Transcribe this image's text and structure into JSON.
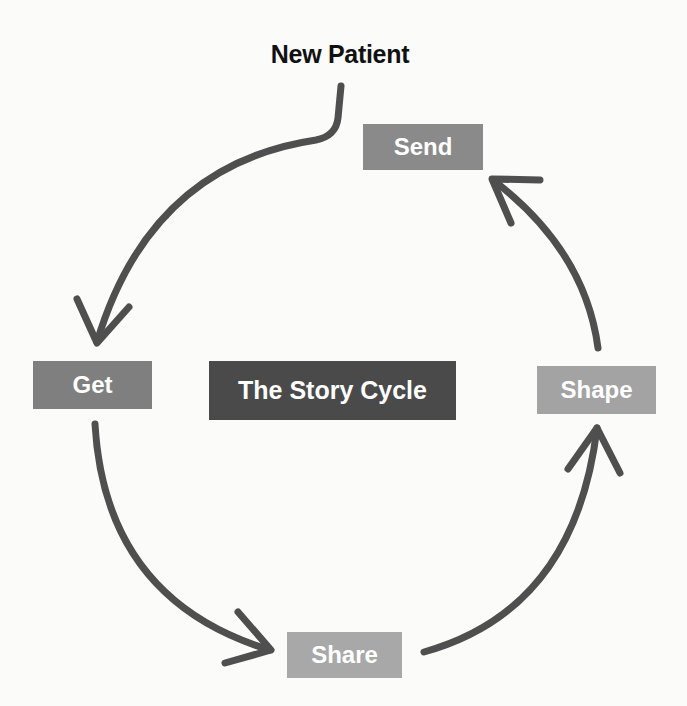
{
  "diagram": {
    "entry_label": "New Patient",
    "center": {
      "label": "The Story Cycle",
      "color": "#4a4a4a"
    },
    "nodes": [
      {
        "id": "send",
        "label": "Send",
        "color": "#8a8a8a"
      },
      {
        "id": "get",
        "label": "Get",
        "color": "#7f7f7f"
      },
      {
        "id": "shape",
        "label": "Shape",
        "color": "#a3a3a3"
      },
      {
        "id": "share",
        "label": "Share",
        "color": "#a8a8a8"
      }
    ],
    "edges": [
      {
        "from": "New Patient",
        "to": "Get"
      },
      {
        "from": "Get",
        "to": "Share"
      },
      {
        "from": "Share",
        "to": "Shape"
      },
      {
        "from": "Shape",
        "to": "Send"
      }
    ],
    "arrow_color": "#4f4f4f"
  }
}
